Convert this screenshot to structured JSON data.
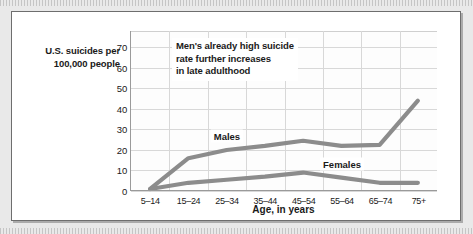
{
  "chart_data": {
    "type": "line",
    "title": "",
    "xlabel": "Age, in years",
    "ylabel": "U.S. suicides per\n100,000 people",
    "categories": [
      "5–14",
      "15–24",
      "25–34",
      "35–44",
      "45–54",
      "55–64",
      "65–74",
      "75+"
    ],
    "series": [
      {
        "name": "Males",
        "values": [
          1,
          16,
          20,
          22,
          24.5,
          22,
          22.5,
          44
        ],
        "color": "#8c8c8c"
      },
      {
        "name": "Females",
        "values": [
          1,
          4,
          5.5,
          7,
          9,
          6.5,
          4,
          4
        ],
        "color": "#8c8c8c"
      }
    ],
    "ylim": [
      0,
      78
    ],
    "yticks": [
      0,
      10,
      20,
      30,
      40,
      50,
      60,
      70
    ],
    "ytick_labels": [
      "0",
      "10",
      "20",
      "30",
      "40",
      "50",
      "60",
      "70"
    ],
    "grid": true,
    "legend": "inline-series-labels",
    "annotations": [
      {
        "name": "men-rate-note",
        "text": "Men's already high suicide\nrate further increases\nin late adulthood"
      }
    ]
  },
  "labels": {
    "y_axis_title_line1": "U.S. suicides per",
    "y_axis_title_line2": "100,000 people",
    "x_axis_title": "Age, in years",
    "series_males": "Males",
    "series_females": "Females",
    "annotation_note": "Men's already high suicide\nrate further increases\nin late adulthood"
  },
  "colors": {
    "line": "#8c8c8c",
    "grid": "#d8d8d8",
    "axis": "#9a9a9a",
    "text": "#1a1a1a",
    "plot_background": "#fdfdfd",
    "figure_background": "#ffffff",
    "page_background": "#e9e9e9"
  }
}
